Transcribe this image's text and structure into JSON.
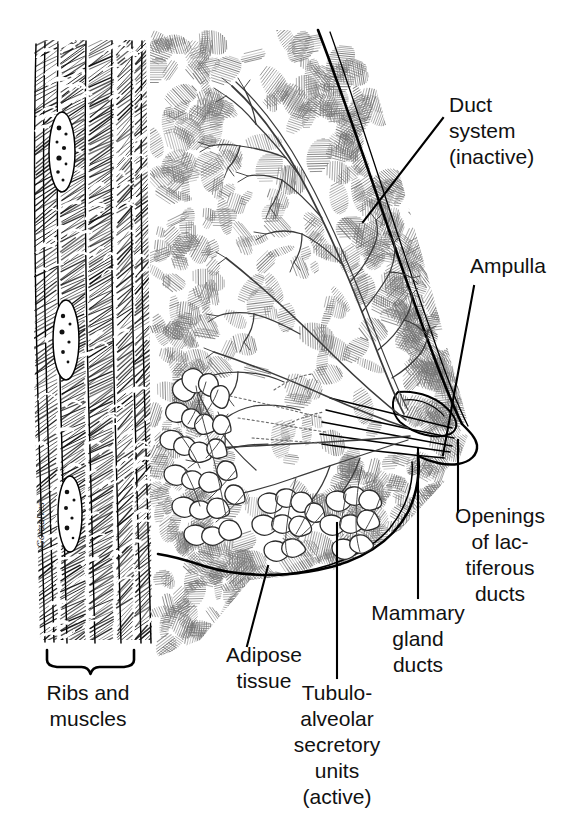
{
  "figure": {
    "background_color": "#ffffff",
    "ink_color": "#000000",
    "width": 587,
    "height": 820,
    "artist_signature": "Gonzalves"
  },
  "labels": [
    {
      "id": "duct-system",
      "name": "duct-system",
      "lines": [
        "Duct",
        "system",
        "(inactive)"
      ],
      "x": 449,
      "y": 112,
      "anchor": "start",
      "leader": "M 443 118 L 363 222"
    },
    {
      "id": "ampulla",
      "name": "ampulla",
      "lines": [
        "Ampulla"
      ],
      "x": 470,
      "y": 273,
      "anchor": "start",
      "leader": "M 474 286 L 443 455"
    },
    {
      "id": "openings-of-lactiferous-ducts",
      "name": "openings-of-lactiferous-ducts",
      "lines": [
        "Openings",
        "of lac-",
        "tiferous",
        "ducts"
      ],
      "x": 500,
      "y": 523,
      "anchor": "middle",
      "leader": "M 458 512 L 458 440"
    },
    {
      "id": "mammary-gland-ducts",
      "name": "mammary-gland-ducts",
      "lines": [
        "Mammary",
        "gland",
        "ducts"
      ],
      "x": 418,
      "y": 620,
      "anchor": "middle",
      "leader": "M 418 598 L 418 448"
    },
    {
      "id": "tubulo-alveolar-secretory-units",
      "name": "tubulo-alveolar-secretory-units",
      "lines": [
        "Tubulo-",
        "alveolar",
        "secretory",
        "units",
        "(active)"
      ],
      "x": 337,
      "y": 700,
      "anchor": "middle",
      "leader": "M 337 678 L 337 523"
    },
    {
      "id": "adipose-tissue",
      "name": "adipose-tissue",
      "lines": [
        "Adipose",
        "tissue"
      ],
      "x": 264,
      "y": 662,
      "anchor": "middle",
      "leader": "M 247 646 L 268 566"
    },
    {
      "id": "ribs-and-muscles",
      "name": "ribs-and-muscles",
      "lines": [
        "Ribs and",
        "muscles"
      ],
      "x": 88,
      "y": 700,
      "anchor": "middle",
      "leader": ""
    }
  ],
  "brace": {
    "name": "ribs-and-muscles-brace",
    "x_left": 47,
    "x_right": 134,
    "y_top": 650,
    "y_bottom": 674
  },
  "structures": [
    {
      "name": "chest-wall-muscle-band",
      "description": "vertical hatched rib and muscle layer at left"
    },
    {
      "name": "rib-cross-sections",
      "description": "three white ovals with dark dots within muscle band"
    },
    {
      "name": "breast-outline",
      "description": "skin contour sweeping from upper left to nipple and around lower margin"
    },
    {
      "name": "nipple",
      "description": "projecting nipple at right with lactiferous duct openings"
    },
    {
      "name": "inactive-duct-tree",
      "description": "branching duct system filling upper breast"
    },
    {
      "name": "active-alveolar-clusters",
      "description": "grape-like tubulo-alveolar secretory units in lower breast"
    },
    {
      "name": "adipose-hatch-field",
      "description": "stippled and hatched blobs representing fat lobules"
    }
  ]
}
